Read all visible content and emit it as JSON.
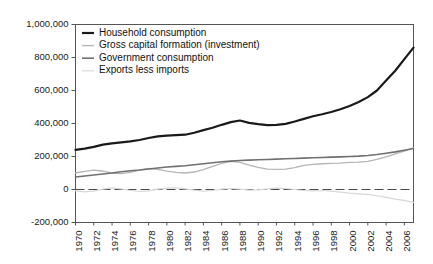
{
  "chart_data": {
    "type": "line",
    "title": "",
    "subtitle": "",
    "xlabel": "",
    "ylabel": "",
    "grid": false,
    "legend_position": "top-left-inside",
    "xlim": [
      1970,
      2007
    ],
    "ylim": [
      -200000,
      1000000
    ],
    "x": [
      1970,
      1971,
      1972,
      1973,
      1974,
      1975,
      1976,
      1977,
      1978,
      1979,
      1980,
      1981,
      1982,
      1983,
      1984,
      1985,
      1986,
      1987,
      1988,
      1989,
      1990,
      1991,
      1992,
      1993,
      1994,
      1995,
      1996,
      1997,
      1998,
      1999,
      2000,
      2001,
      2002,
      2003,
      2004,
      2005,
      2006,
      2007
    ],
    "xtick_labels": [
      "1970",
      "1972",
      "1974",
      "1976",
      "1978",
      "1980",
      "1982",
      "1984",
      "1986",
      "1988",
      "1990",
      "1992",
      "1994",
      "1996",
      "1998",
      "2000",
      "2002",
      "2004",
      "2006"
    ],
    "ytick_labels": [
      "1,000,000",
      "800,000",
      "600,000",
      "400,000",
      "200,000",
      "0",
      "-200,000"
    ],
    "ytick_values": [
      1000000,
      800000,
      600000,
      400000,
      200000,
      0,
      -200000
    ],
    "series": [
      {
        "name": "Household consumption",
        "color": "#1a1a1a",
        "width": 2.2,
        "values": [
          240000,
          248000,
          258000,
          272000,
          280000,
          286000,
          292000,
          300000,
          312000,
          322000,
          326000,
          330000,
          332000,
          344000,
          360000,
          374000,
          392000,
          408000,
          418000,
          404000,
          396000,
          390000,
          392000,
          398000,
          412000,
          428000,
          444000,
          456000,
          470000,
          486000,
          506000,
          530000,
          560000,
          600000,
          660000,
          720000,
          790000,
          860000
        ]
      },
      {
        "name": "Gross capital formation (investment)",
        "color": "#b5b5b5",
        "width": 1.3,
        "values": [
          100000,
          110000,
          118000,
          112000,
          100000,
          96000,
          104000,
          118000,
          128000,
          122000,
          112000,
          104000,
          100000,
          106000,
          120000,
          140000,
          158000,
          170000,
          164000,
          148000,
          134000,
          124000,
          122000,
          124000,
          132000,
          146000,
          152000,
          156000,
          158000,
          160000,
          164000,
          166000,
          170000,
          182000,
          198000,
          216000,
          232000,
          252000
        ]
      },
      {
        "name": "Government consumption",
        "color": "#707070",
        "width": 1.6,
        "values": [
          76000,
          82000,
          88000,
          94000,
          100000,
          108000,
          114000,
          118000,
          124000,
          130000,
          136000,
          140000,
          144000,
          150000,
          156000,
          162000,
          168000,
          172000,
          176000,
          178000,
          180000,
          182000,
          184000,
          186000,
          188000,
          190000,
          192000,
          194000,
          196000,
          198000,
          200000,
          202000,
          206000,
          212000,
          220000,
          228000,
          238000,
          248000
        ]
      },
      {
        "name": "Exports less imports",
        "color": "#d8d8d8",
        "width": 1.2,
        "values": [
          -8000,
          -14000,
          -10000,
          2000,
          10000,
          4000,
          -6000,
          -12000,
          -8000,
          2000,
          8000,
          10000,
          4000,
          -4000,
          -10000,
          -6000,
          2000,
          6000,
          2000,
          -4000,
          -2000,
          4000,
          8000,
          6000,
          0,
          -6000,
          -8000,
          -6000,
          -10000,
          -16000,
          -22000,
          -26000,
          -30000,
          -38000,
          -48000,
          -58000,
          -66000,
          -78000
        ]
      }
    ]
  },
  "legend": {
    "items": [
      {
        "label": "Household consumption"
      },
      {
        "label": "Gross capital formation (investment)"
      },
      {
        "label": "Government consumption"
      },
      {
        "label": "Exports less imports"
      }
    ]
  }
}
